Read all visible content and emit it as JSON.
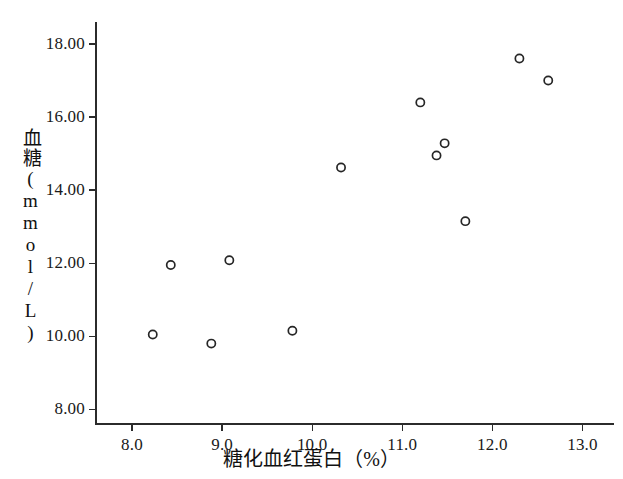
{
  "chart_data": {
    "type": "scatter",
    "title": "",
    "xlabel": "糖化血红蛋白（%）",
    "ylabel": "血糖(mmol/L)",
    "xlim": [
      7.6,
      13.35
    ],
    "ylim": [
      7.6,
      18.6
    ],
    "xticks": [
      8.0,
      9.0,
      10.0,
      11.0,
      12.0,
      13.0
    ],
    "xticklabels": [
      "8.0",
      "9.0",
      "10.0",
      "11.0",
      "12.0",
      "13.0"
    ],
    "yticks": [
      8.0,
      10.0,
      12.0,
      14.0,
      16.0,
      18.0
    ],
    "yticklabels": [
      "8.00",
      "10.00",
      "12.00",
      "14.00",
      "16.00",
      "18.00"
    ],
    "grid": false,
    "legend": null,
    "marker": "open-circle",
    "marker_color": "#262626",
    "x": [
      8.23,
      8.43,
      8.88,
      9.08,
      9.78,
      10.32,
      11.2,
      11.38,
      11.47,
      11.7,
      12.3,
      12.62
    ],
    "y": [
      10.05,
      11.95,
      9.8,
      12.08,
      10.15,
      14.62,
      16.4,
      14.95,
      15.28,
      13.15,
      17.6,
      17.0
    ],
    "points": [
      {
        "x": 8.23,
        "y": 10.05
      },
      {
        "x": 8.43,
        "y": 11.95
      },
      {
        "x": 8.88,
        "y": 9.8
      },
      {
        "x": 9.08,
        "y": 12.08
      },
      {
        "x": 9.78,
        "y": 10.15
      },
      {
        "x": 10.32,
        "y": 14.62
      },
      {
        "x": 11.2,
        "y": 16.4
      },
      {
        "x": 11.38,
        "y": 14.95
      },
      {
        "x": 11.47,
        "y": 15.28
      },
      {
        "x": 11.7,
        "y": 13.15
      },
      {
        "x": 12.3,
        "y": 17.6
      },
      {
        "x": 12.62,
        "y": 17.0
      }
    ]
  },
  "axes": {
    "axis_color": "#2b2b2b",
    "background": "#ffffff"
  }
}
